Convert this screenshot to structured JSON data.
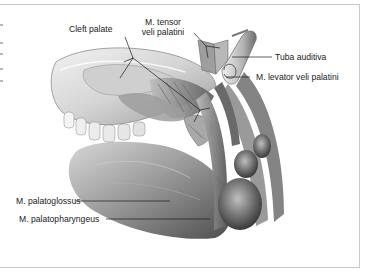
{
  "figure": {
    "labels": {
      "cleft_palate": "Cleft palate",
      "tensor_line1": "M. tensor",
      "tensor_line2": "veli palatini",
      "tuba_auditiva": "Tuba auditiva",
      "levator": "M. levator veli palatini",
      "palatoglossus": "M. palatoglossus",
      "palatopharyngeus": "M. palatopharyngeus"
    },
    "colors": {
      "border": "#c8c8c8",
      "label_text": "#222222",
      "leader_line": "#1a1a1a",
      "tissue_light": "#e6e6e6",
      "tissue_mid": "#a8a8a8",
      "tissue_dark": "#5a5a5a"
    }
  }
}
